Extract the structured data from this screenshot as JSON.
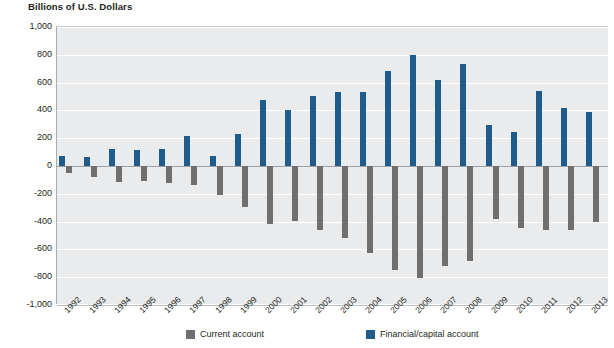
{
  "chart_data": {
    "type": "bar",
    "title": "Billions of U.S. Dollars",
    "xlabel": "",
    "ylabel": "Billions of U.S. Dollars",
    "ylim": [
      -1000,
      1000
    ],
    "ytick_labels": [
      "1,000",
      "800",
      "600",
      "400",
      "200",
      "0",
      "-200",
      "-400",
      "-600",
      "-800",
      "-1,000"
    ],
    "ytick_values": [
      1000,
      800,
      600,
      400,
      200,
      0,
      -200,
      -400,
      -600,
      -800,
      -1000
    ],
    "grid": true,
    "legend_position": "bottom",
    "categories": [
      "1992",
      "1993",
      "1994",
      "1995",
      "1996",
      "1997",
      "1998",
      "1999",
      "2000",
      "2001",
      "2002",
      "2003",
      "2004",
      "2005",
      "2006",
      "2007",
      "2008",
      "2009",
      "2010",
      "2011",
      "2012",
      "2013"
    ],
    "series": [
      {
        "name": "Current account",
        "color": "#6f6f6f",
        "values": [
          -50,
          -82,
          -118,
          -110,
          -120,
          -136,
          -210,
          -297,
          -416,
          -397,
          -458,
          -519,
          -629,
          -745,
          -807,
          -719,
          -687,
          -381,
          -444,
          -459,
          -461,
          -400
        ]
      },
      {
        "name": "Financial/capital account",
        "color": "#1f5c8b",
        "values": [
          72,
          68,
          119,
          117,
          122,
          219,
          72,
          228,
          472,
          400,
          501,
          533,
          532,
          687,
          799,
          617,
          733,
          292,
          247,
          538,
          418,
          386
        ]
      }
    ]
  },
  "legend": {
    "items": [
      {
        "label": "Current account",
        "color": "#6f6f6f"
      },
      {
        "label": "Financial/capital account",
        "color": "#1f5c8b"
      }
    ]
  }
}
